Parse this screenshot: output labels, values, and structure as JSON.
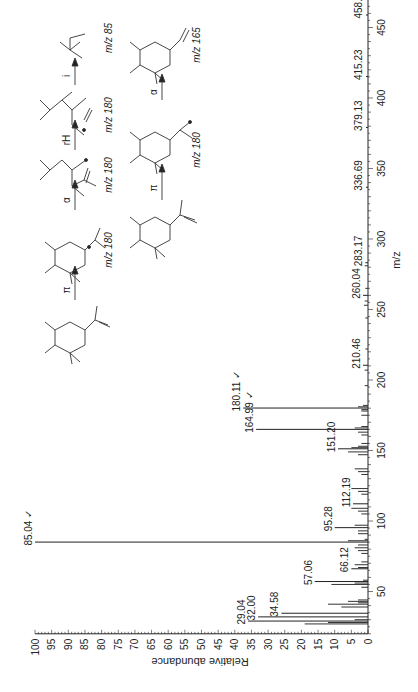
{
  "chart_data": {
    "type": "bar",
    "title": "",
    "xlabel": "m/z",
    "ylabel": "Relative abundance",
    "xlim": [
      20,
      500
    ],
    "ylim": [
      0,
      100
    ],
    "orientation": "rotated-90-ccw",
    "x_ticks": [
      50,
      100,
      150,
      200,
      250,
      300,
      350,
      400,
      450
    ],
    "y_ticks": [
      0,
      5,
      10,
      15,
      20,
      25,
      30,
      35,
      40,
      45,
      50,
      55,
      60,
      65,
      70,
      75,
      80,
      85,
      90,
      95,
      100
    ],
    "labeled_peaks": [
      {
        "mz": 29.04,
        "label": "29.04",
        "abundance": 36,
        "check": false
      },
      {
        "mz": 32.0,
        "label": "32.00",
        "abundance": 33,
        "check": false
      },
      {
        "mz": 34.58,
        "label": "34.58",
        "abundance": 26,
        "check": false
      },
      {
        "mz": 57.06,
        "label": "57.06",
        "abundance": 16,
        "check": false
      },
      {
        "mz": 66.12,
        "label": "66.12",
        "abundance": 5,
        "check": false
      },
      {
        "mz": 85.04,
        "label": "85.04",
        "abundance": 100,
        "check": true
      },
      {
        "mz": 95.28,
        "label": "95.28",
        "abundance": 10,
        "check": false
      },
      {
        "mz": 112.19,
        "label": "112.19",
        "abundance": 4.5,
        "check": false
      },
      {
        "mz": 151.2,
        "label": "151.20",
        "abundance": 9,
        "check": false
      },
      {
        "mz": 164.99,
        "label": "164.99",
        "abundance": 33.6,
        "check": true
      },
      {
        "mz": 180.11,
        "label": "180.11",
        "abundance": 37.5,
        "check": true
      },
      {
        "mz": 210.46,
        "label": "210.46",
        "abundance": 1.5,
        "check": false
      },
      {
        "mz": 260.04,
        "label": "260.04",
        "abundance": 1.5,
        "check": false
      },
      {
        "mz": 283.17,
        "label": "283.17",
        "abundance": 0.8,
        "check": false
      },
      {
        "mz": 336.69,
        "label": "336.69",
        "abundance": 0.6,
        "check": false
      },
      {
        "mz": 379.13,
        "label": "379.13",
        "abundance": 0.6,
        "check": false
      },
      {
        "mz": 415.23,
        "label": "415.23",
        "abundance": 0.6,
        "check": false
      },
      {
        "mz": 458.85,
        "label": "458.85",
        "abundance": 0.6,
        "check": false
      },
      {
        "mz": 492.33,
        "label": "492.33",
        "abundance": 0.6,
        "check": false
      }
    ],
    "minor_peaks": [
      {
        "mz": 27,
        "abundance": 19
      },
      {
        "mz": 28,
        "abundance": 12
      },
      {
        "mz": 30,
        "abundance": 4
      },
      {
        "mz": 39,
        "abundance": 8
      },
      {
        "mz": 41,
        "abundance": 12
      },
      {
        "mz": 42,
        "abundance": 3
      },
      {
        "mz": 43,
        "abundance": 6
      },
      {
        "mz": 44,
        "abundance": 3
      },
      {
        "mz": 53,
        "abundance": 2
      },
      {
        "mz": 55,
        "abundance": 11
      },
      {
        "mz": 56,
        "abundance": 4
      },
      {
        "mz": 58,
        "abundance": 1.5
      },
      {
        "mz": 67,
        "abundance": 3
      },
      {
        "mz": 69,
        "abundance": 4
      },
      {
        "mz": 71,
        "abundance": 2
      },
      {
        "mz": 77,
        "abundance": 2
      },
      {
        "mz": 79,
        "abundance": 3
      },
      {
        "mz": 81,
        "abundance": 4
      },
      {
        "mz": 83,
        "abundance": 3
      },
      {
        "mz": 86,
        "abundance": 6
      },
      {
        "mz": 87,
        "abundance": 1
      },
      {
        "mz": 91,
        "abundance": 3
      },
      {
        "mz": 93,
        "abundance": 3
      },
      {
        "mz": 97,
        "abundance": 4
      },
      {
        "mz": 105,
        "abundance": 2
      },
      {
        "mz": 107,
        "abundance": 3
      },
      {
        "mz": 109,
        "abundance": 5
      },
      {
        "mz": 119,
        "abundance": 2
      },
      {
        "mz": 121,
        "abundance": 3
      },
      {
        "mz": 123,
        "abundance": 5
      },
      {
        "mz": 133,
        "abundance": 2
      },
      {
        "mz": 135,
        "abundance": 3
      },
      {
        "mz": 137,
        "abundance": 4
      },
      {
        "mz": 147,
        "abundance": 3
      },
      {
        "mz": 149,
        "abundance": 6
      },
      {
        "mz": 152,
        "abundance": 5
      },
      {
        "mz": 153,
        "abundance": 3
      },
      {
        "mz": 155,
        "abundance": 2
      },
      {
        "mz": 161,
        "abundance": 2
      },
      {
        "mz": 163,
        "abundance": 3
      },
      {
        "mz": 166,
        "abundance": 4
      },
      {
        "mz": 167,
        "abundance": 2
      },
      {
        "mz": 175,
        "abundance": 2
      },
      {
        "mz": 178,
        "abundance": 2
      },
      {
        "mz": 179,
        "abundance": 2
      },
      {
        "mz": 181,
        "abundance": 3
      },
      {
        "mz": 182,
        "abundance": 1.5
      },
      {
        "mz": 196,
        "abundance": 1
      },
      {
        "mz": 207,
        "abundance": 1
      },
      {
        "mz": 222,
        "abundance": 0.8
      },
      {
        "mz": 244,
        "abundance": 0.8
      },
      {
        "mz": 253,
        "abundance": 1.2
      },
      {
        "mz": 256,
        "abundance": 1
      },
      {
        "mz": 265,
        "abundance": 0.8
      },
      {
        "mz": 281,
        "abundance": 1
      }
    ]
  },
  "scheme": {
    "labels": {
      "m180a": "m/z 180",
      "m180b": "m/z 180",
      "m85": "m/z 85",
      "m180c": "m/z 180",
      "m165": "m/z 165"
    },
    "arrows": {
      "top_pi": "π",
      "top_alpha": "α",
      "top_rh": "rH",
      "top_rh_sub": "A",
      "top_i": "i",
      "bottom_pi": "π",
      "bottom_alpha": "α"
    }
  }
}
